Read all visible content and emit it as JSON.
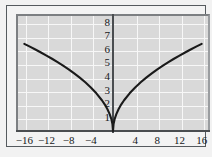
{
  "chart_data": {
    "type": "line",
    "title": "",
    "subtitle": "",
    "xlabel": "",
    "ylabel": "",
    "xlim": [
      -17.5,
      17.5
    ],
    "ylim": [
      0,
      8.6
    ],
    "grid": true,
    "legend": null,
    "x_ticks": [
      -16,
      -12,
      -8,
      -4,
      4,
      8,
      12,
      16
    ],
    "x_tick_labels": [
      "−16",
      "−12",
      "−8",
      "−4",
      "4",
      "8",
      "12",
      "16"
    ],
    "y_ticks": [
      1,
      2,
      3,
      4,
      5,
      6,
      7,
      8
    ],
    "y_tick_labels": [
      "1",
      "2",
      "3",
      "4",
      "5",
      "6",
      "7",
      "8"
    ],
    "series": [
      {
        "name": "y = 1.6√|x|",
        "color": "#1a1a1a",
        "x": [
          -16,
          -15,
          -14,
          -13,
          -12,
          -11,
          -10,
          -9,
          -8,
          -7,
          -6,
          -5,
          -4,
          -3,
          -2,
          -1.5,
          -1,
          -0.6,
          -0.3,
          -0.1,
          0,
          0.1,
          0.3,
          0.6,
          1,
          1.5,
          2,
          3,
          4,
          5,
          6,
          7,
          8,
          9,
          10,
          11,
          12,
          13,
          14,
          15,
          16
        ],
        "y": [
          6.4,
          6.2,
          5.99,
          5.77,
          5.54,
          5.31,
          5.06,
          4.8,
          4.53,
          4.23,
          3.92,
          3.58,
          3.2,
          2.77,
          2.26,
          1.96,
          1.6,
          1.24,
          0.88,
          0.51,
          0,
          0.51,
          0.88,
          1.24,
          1.6,
          1.96,
          2.26,
          2.77,
          3.2,
          3.58,
          3.92,
          4.23,
          4.53,
          4.8,
          5.06,
          5.31,
          5.54,
          5.77,
          5.99,
          6.2,
          6.4
        ]
      }
    ]
  },
  "style": {
    "panel_background": "#d9d9d9",
    "gridline_color": "#f7f7f7",
    "axis_color": "#4a4d50",
    "curve_color": "#1a1a1a",
    "frame_color": "#555a5e",
    "page_background": "#f2f2f2"
  }
}
